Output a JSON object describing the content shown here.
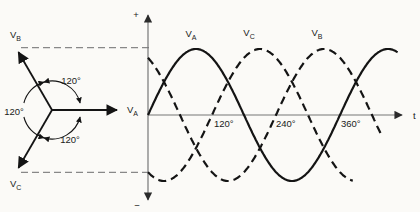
{
  "phasor": {
    "vectors": [
      {
        "name": "V_B",
        "base": "V",
        "sub": "B",
        "angle_deg": 120
      },
      {
        "name": "V_A",
        "base": "V",
        "sub": "A",
        "angle_deg": 0
      },
      {
        "name": "V_C",
        "base": "V",
        "sub": "C",
        "angle_deg": 240
      }
    ],
    "angles": {
      "top": "120°",
      "left": "120°",
      "bottom": "120°"
    }
  },
  "waveform_axes": {
    "plus": "+",
    "minus": "−"
  },
  "chart_data": {
    "type": "line",
    "x_unit": "degrees",
    "xlabel": "t",
    "x_ticks_deg": [
      120,
      240,
      360
    ],
    "x_tick_labels": [
      "120°",
      "240°",
      "360°"
    ],
    "amplitude": 1,
    "ylim": [
      -1,
      1
    ],
    "series": [
      {
        "name": "V_A",
        "base": "V",
        "sub": "A",
        "style": "solid",
        "phase_lag_deg": 0,
        "theta_end_deg": 468
      },
      {
        "name": "V_C",
        "base": "V",
        "sub": "C",
        "style": "dashed",
        "phase_lag_deg": 120,
        "theta_end_deg": 385
      },
      {
        "name": "V_B",
        "base": "V",
        "sub": "B",
        "style": "dashed",
        "phase_lag_deg": 240,
        "theta_end_deg": 440
      }
    ]
  },
  "colors": {
    "ink": "#141414",
    "axis": "#777777",
    "background": "#fbfaf7"
  }
}
